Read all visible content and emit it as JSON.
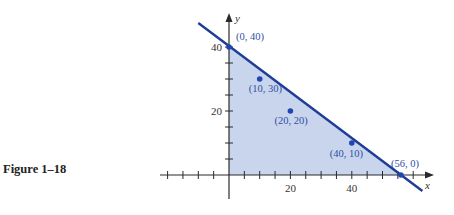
{
  "caption": "Figure 1–18",
  "colors": {
    "axis": "#2a2a2a",
    "line": "#1f3d96",
    "fill": "#c9d5ec",
    "point": "#2347b0",
    "label": "#2f4ea6"
  },
  "chart_data": {
    "type": "line",
    "title": "",
    "xlabel": "x",
    "ylabel": "y",
    "x_ticks_labeled": [
      20,
      40
    ],
    "y_ticks_labeled": [
      20,
      40
    ],
    "tick_step": 5,
    "xlim": [
      -20,
      65
    ],
    "ylim": [
      -7,
      50
    ],
    "grid": false,
    "series": [
      {
        "name": "boundary line",
        "x": [
          -10,
          0,
          56,
          63
        ],
        "y": [
          47.5,
          40,
          0,
          -5
        ]
      }
    ],
    "shaded_region": {
      "vertices": [
        [
          0,
          0
        ],
        [
          0,
          40
        ],
        [
          56,
          0
        ]
      ],
      "description": "feasible region x≥0, y≥0, below line"
    },
    "points": [
      {
        "x": 0,
        "y": 40,
        "label": "(0, 40)"
      },
      {
        "x": 10,
        "y": 30,
        "label": "(10, 30)"
      },
      {
        "x": 20,
        "y": 20,
        "label": "(20, 20)"
      },
      {
        "x": 40,
        "y": 10,
        "label": "(40, 10)"
      },
      {
        "x": 56,
        "y": 0,
        "label": "(56, 0)"
      }
    ]
  }
}
